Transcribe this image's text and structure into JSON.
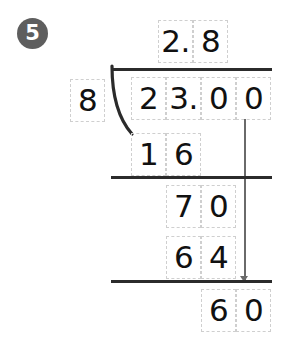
{
  "problem": {
    "number": "5",
    "badge_color": "#5e5e5e",
    "ink_color": "#111111",
    "rule_color": "#2b2b2b",
    "bringdown_color": "#6a6a6a",
    "cell_border_color": "#cfcfcf"
  },
  "quotient": {
    "label": "quotient",
    "cells": [
      "2.",
      "8"
    ]
  },
  "divisor": {
    "label": "divisor",
    "value": "8"
  },
  "dividend": {
    "label": "dividend",
    "cells": [
      "2",
      "3.",
      "0",
      "0"
    ]
  },
  "steps": [
    {
      "label": "partial-product-1",
      "cells": [
        "1",
        "6",
        "",
        ""
      ]
    },
    {
      "label": "partial-remainder-1",
      "cells": [
        "",
        "7",
        "0",
        ""
      ]
    },
    {
      "label": "partial-product-2",
      "cells": [
        "",
        "6",
        "4",
        ""
      ]
    },
    {
      "label": "remainder-final",
      "cells": [
        "",
        "",
        "6",
        "0"
      ]
    }
  ],
  "expression": {
    "dividend_value": "23.00",
    "divisor_value": "8",
    "quotient_value": "2.8"
  }
}
